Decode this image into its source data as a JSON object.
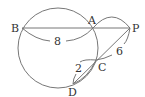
{
  "diagram": {
    "type": "geometry-secant-theorem",
    "colors": {
      "line": "#777777",
      "text": "#333333",
      "background": "#ffffff"
    },
    "circle": {
      "cx": 58,
      "cy": 48,
      "r": 40
    },
    "points": {
      "B": {
        "label": "B",
        "x": 22,
        "y": 28
      },
      "A": {
        "label": "A",
        "x": 93,
        "y": 28
      },
      "P": {
        "label": "P",
        "x": 130,
        "y": 28
      },
      "C": {
        "label": "C",
        "x": 96,
        "y": 60
      },
      "D": {
        "label": "D",
        "x": 73,
        "y": 84
      }
    },
    "segments": [
      {
        "from": "B",
        "to": "P"
      },
      {
        "from": "P",
        "to": "D"
      }
    ],
    "measurements": {
      "BA": {
        "label": "8"
      },
      "PC": {
        "label": "6"
      },
      "CD": {
        "label": "2"
      },
      "AP": {
        "label": ""
      }
    }
  }
}
